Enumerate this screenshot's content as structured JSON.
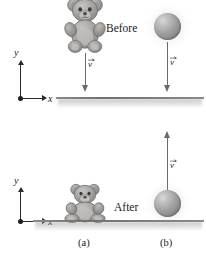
{
  "figure": {
    "background_color": "#ffffff",
    "ground_color": "#7a7a7a",
    "object_color": "#9d9d9d",
    "arrow_color": "#6a6a6a",
    "axis_color": "#2b2b2b"
  },
  "top_panel": {
    "name": "before",
    "phase_label": "Before",
    "axes": {
      "y_label": "y",
      "x_label": "x"
    },
    "bear": {
      "label": "teddy-bear",
      "velocity": {
        "label": "v",
        "direction": "down"
      }
    },
    "ball": {
      "label": "ball",
      "velocity": {
        "label": "v",
        "direction": "down"
      }
    }
  },
  "bottom_panel": {
    "name": "after",
    "phase_label": "After",
    "axes": {
      "y_label": "y",
      "x_label": "x"
    },
    "bear": {
      "label": "teddy-bear",
      "velocity": null
    },
    "ball": {
      "label": "ball",
      "velocity": {
        "label": "v",
        "direction": "up"
      }
    }
  },
  "captions": {
    "column_a": "(a)",
    "column_b": "(b)"
  }
}
